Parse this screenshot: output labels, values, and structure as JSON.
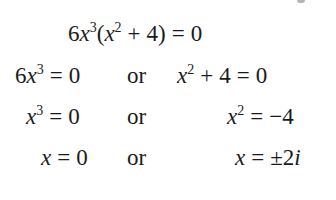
{
  "equation": {
    "line1": {
      "coef": "6",
      "var": "x",
      "exp": "3",
      "open": "(",
      "var2": "x",
      "exp2": "2",
      "plus": "+",
      "const": "4",
      "close": ")",
      "eq": "=",
      "rhs": "0"
    },
    "line2": {
      "left": {
        "coef": "6",
        "var": "x",
        "exp": "3",
        "eq": "=",
        "rhs": "0"
      },
      "connector": "or",
      "right": {
        "var": "x",
        "exp": "2",
        "plus": "+",
        "const": "4",
        "eq": "=",
        "rhs": "0"
      }
    },
    "line3": {
      "left": {
        "var": "x",
        "exp": "3",
        "eq": "=",
        "rhs": "0"
      },
      "connector": "or",
      "right": {
        "var": "x",
        "exp": "2",
        "eq": "=",
        "rhs": "−4"
      }
    },
    "line4": {
      "left": {
        "var": "x",
        "eq": "=",
        "rhs": "0"
      },
      "connector": "or",
      "right": {
        "var": "x",
        "eq": "=",
        "rhs_pm": "±",
        "rhs_num": "2",
        "rhs_i": "i"
      }
    }
  }
}
